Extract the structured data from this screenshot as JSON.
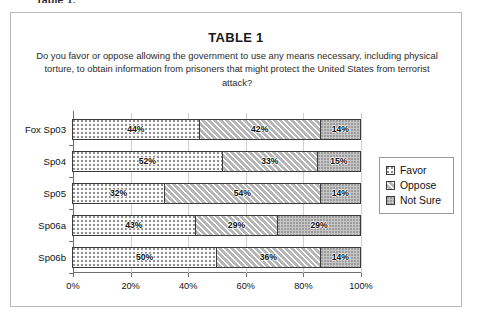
{
  "caption_top": "Table 1.",
  "figure": {
    "title": "TABLE 1",
    "question": "Do you favor or oppose allowing the government to use any means necessary, including physical torture, to obtain information from prisoners that might protect the United States from terrorist attack?"
  },
  "legend": {
    "items": [
      {
        "label": "Favor",
        "pattern": "dotted-light"
      },
      {
        "label": "Oppose",
        "pattern": "diagonal-hatch"
      },
      {
        "label": "Not Sure",
        "pattern": "grey-speckle"
      }
    ]
  },
  "axis": {
    "x_ticks": [
      "0%",
      "20%",
      "40%",
      "60%",
      "80%",
      "100%"
    ],
    "x_tick_values": [
      0,
      20,
      40,
      60,
      80,
      100
    ]
  },
  "rows": [
    {
      "category": "Fox Sp03",
      "favor": "44%",
      "oppose": "42%",
      "not_sure": "14%",
      "favor_v": 44,
      "oppose_v": 42,
      "not_sure_v": 14
    },
    {
      "category": "Sp04",
      "favor": "52%",
      "oppose": "33%",
      "not_sure": "15%",
      "favor_v": 52,
      "oppose_v": 33,
      "not_sure_v": 15
    },
    {
      "category": "Sp05",
      "favor": "32%",
      "oppose": "54%",
      "not_sure": "14%",
      "favor_v": 32,
      "oppose_v": 54,
      "not_sure_v": 14
    },
    {
      "category": "Sp06a",
      "favor": "43%",
      "oppose": "29%",
      "not_sure": "29%",
      "favor_v": 43,
      "oppose_v": 29,
      "not_sure_v": 29
    },
    {
      "category": "Sp06b",
      "favor": "50%",
      "oppose": "36%",
      "not_sure": "14%",
      "favor_v": 50,
      "oppose_v": 36,
      "not_sure_v": 14
    }
  ],
  "chart_data": {
    "type": "bar",
    "orientation": "horizontal",
    "stacked": true,
    "title": "TABLE 1",
    "subtitle": "Do you favor or oppose allowing the government to use any means necessary, including physical torture, to obtain information from prisoners that might protect the United States from terrorist attack?",
    "categories": [
      "Fox Sp03",
      "Sp04",
      "Sp05",
      "Sp06a",
      "Sp06b"
    ],
    "series": [
      {
        "name": "Favor",
        "values": [
          44,
          52,
          32,
          43,
          50
        ]
      },
      {
        "name": "Oppose",
        "values": [
          42,
          33,
          54,
          29,
          36
        ]
      },
      {
        "name": "Not Sure",
        "values": [
          14,
          15,
          14,
          29,
          14
        ]
      }
    ],
    "data_labels": [
      [
        "44%",
        "42%",
        "14%"
      ],
      [
        "52%",
        "33%",
        "15%"
      ],
      [
        "32%",
        "54%",
        "14%"
      ],
      [
        "43%",
        "29%",
        "29%"
      ],
      [
        "50%",
        "36%",
        "14%"
      ]
    ],
    "xlabel": "",
    "ylabel": "",
    "xlim": [
      0,
      100
    ],
    "xticks": [
      0,
      20,
      40,
      60,
      80,
      100
    ],
    "xticklabels": [
      "0%",
      "20%",
      "40%",
      "60%",
      "80%",
      "100%"
    ],
    "grid": true,
    "legend_position": "right",
    "units": "percent"
  }
}
